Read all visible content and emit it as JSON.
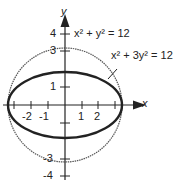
{
  "diagram": {
    "axes": {
      "x_label": "x",
      "y_label": "y"
    },
    "x_ticks": [
      "-2",
      "-1",
      "1",
      "2"
    ],
    "y_ticks": [
      "4",
      "3",
      "1",
      "-3",
      "-4"
    ],
    "curves": [
      {
        "name": "circle",
        "equation": "x² + y² = 12",
        "style": "thin dotted"
      },
      {
        "name": "ellipse",
        "equation": "x² + 3y² = 12",
        "style": "thick solid"
      }
    ]
  }
}
